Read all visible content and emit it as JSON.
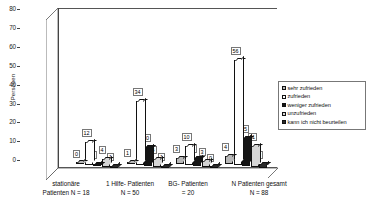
{
  "chart_data": {
    "type": "bar",
    "title": "",
    "subtitle": "",
    "xlabel": "",
    "ylabel": "Personen",
    "ylim": [
      0,
      85
    ],
    "yticks": [
      0,
      10,
      20,
      30,
      40,
      50,
      60,
      70,
      80
    ],
    "grid": false,
    "legend_position": "right",
    "three_d": true,
    "categories": [
      "stationäre Patienten N = 18",
      "1 Hilfe- Patienten N = 50",
      "BG- Patienten = 20",
      "N Patienten gesamt N = 88"
    ],
    "category_lines": [
      [
        "stationäre",
        "Patienten N = 18"
      ],
      [
        "1 Hilfe- Patienten",
        "N = 50"
      ],
      [
        "BG- Patienten",
        "= 20"
      ],
      [
        "N Patienten gesamt",
        "N = 88"
      ]
    ],
    "series": [
      {
        "name": "sehr zufrieden",
        "color": "#b8b8b8",
        "values": [
          0,
          1,
          3,
          4
        ]
      },
      {
        "name": "zufrieden",
        "color": "#ffffff",
        "values": [
          12,
          34,
          10,
          56
        ]
      },
      {
        "name": "weniger zufrieden",
        "color": "#151515",
        "values": [
          1,
          10,
          4,
          15
        ]
      },
      {
        "name": "unzufrieden",
        "color": "#d6d6d6",
        "values": [
          4,
          4,
          3,
          11
        ]
      },
      {
        "name": "kann ich nicht beurteilen",
        "color": "#2a2a2a",
        "values": [
          1,
          1,
          0,
          2
        ]
      }
    ],
    "data_labels": [
      [
        "0",
        "12",
        "1",
        "4",
        "1"
      ],
      [
        "1",
        "34",
        "10",
        "4",
        "1"
      ],
      [
        "3",
        "10",
        "4",
        "3",
        "0"
      ],
      [
        "4",
        "56",
        "15",
        "11",
        "2"
      ]
    ]
  },
  "axis": {
    "y_title": "Personen",
    "y_ticks": [
      "80",
      "70",
      "60",
      "50",
      "40",
      "30",
      "20",
      "10",
      "0"
    ]
  },
  "legend": {
    "items": [
      {
        "label": "sehr zufrieden"
      },
      {
        "label": "zufrieden"
      },
      {
        "label": "weniger zufrieden"
      },
      {
        "label": "unzufrieden"
      },
      {
        "label": "kann ich nicht beurteilen"
      }
    ]
  }
}
